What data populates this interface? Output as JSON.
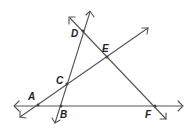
{
  "diagram": {
    "type": "geometry-lines",
    "points": {
      "A": {
        "label": "A",
        "x": 38,
        "y": 105
      },
      "B": {
        "label": "B",
        "x": 61,
        "y": 106
      },
      "C": {
        "label": "C",
        "x": 67,
        "y": 84
      },
      "D": {
        "label": "D",
        "x": 83,
        "y": 31
      },
      "E": {
        "label": "E",
        "x": 107,
        "y": 57
      },
      "F": {
        "label": "F",
        "x": 155,
        "y": 106
      }
    },
    "lines": [
      {
        "name": "line-ABF",
        "through": [
          "A",
          "B",
          "F"
        ]
      },
      {
        "name": "line-ACE",
        "through": [
          "A",
          "C",
          "E"
        ]
      },
      {
        "name": "line-BCD",
        "through": [
          "B",
          "C",
          "D"
        ]
      },
      {
        "name": "line-DEF",
        "through": [
          "D",
          "E",
          "F"
        ]
      }
    ],
    "colors": {
      "stroke": "#555555",
      "label": "#222222"
    }
  }
}
